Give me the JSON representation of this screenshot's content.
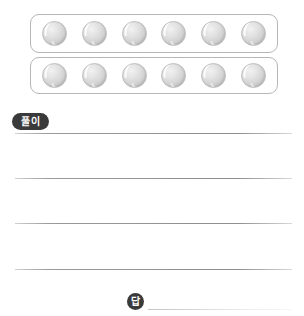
{
  "page": {
    "background_color": "#ffffff",
    "width": 304,
    "height": 316,
    "cropped_header_text": " "
  },
  "figure": {
    "caption": "",
    "tray_border_color": "#b6b6b6",
    "ball_color": "#d2d2d2",
    "ball_icon_name": "ball-icon",
    "rows": [
      {
        "label": "row-1",
        "count": 6,
        "balls": [
          "ball",
          "ball",
          "ball",
          "ball",
          "ball",
          "ball"
        ]
      },
      {
        "label": "row-2",
        "count": 6,
        "balls": [
          "ball",
          "ball",
          "ball",
          "ball",
          "ball",
          "ball"
        ]
      }
    ]
  },
  "solution": {
    "badge_label": "풀이",
    "badge_color": "#3a3a3a",
    "badge_text_color": "#ffffff",
    "lines": [
      "",
      "",
      "",
      ""
    ]
  },
  "answer": {
    "badge_label": "답",
    "badge_color": "#3a3a3a",
    "badge_text_color": "#ffffff",
    "value": ""
  }
}
